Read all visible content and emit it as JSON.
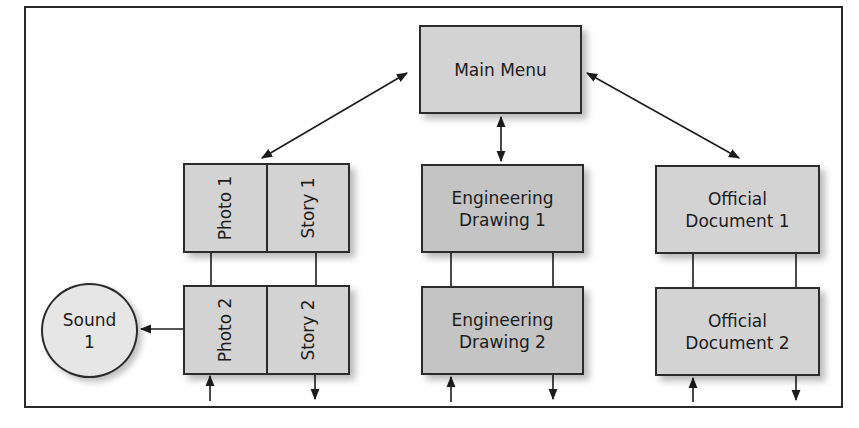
{
  "diagram": {
    "type": "navigation-structure",
    "main_menu": {
      "label": "Main Menu"
    },
    "branches": [
      {
        "id": "photo-story",
        "nodes": [
          {
            "left": "Photo 1",
            "right": "Story 1"
          },
          {
            "left": "Photo 2",
            "right": "Story 2"
          }
        ],
        "side_node": {
          "label_line1": "Sound",
          "label_line2": "1"
        }
      },
      {
        "id": "engineering",
        "nodes": [
          {
            "line1": "Engineering",
            "line2": "Drawing 1"
          },
          {
            "line1": "Engineering",
            "line2": "Drawing 2"
          }
        ]
      },
      {
        "id": "official",
        "nodes": [
          {
            "line1": "Official",
            "line2": "Document 1"
          },
          {
            "line1": "Official",
            "line2": "Document 2"
          }
        ]
      }
    ],
    "connections": [
      {
        "from": "Main Menu",
        "to": "Photo 1 / Story 1",
        "style": "bidirectional-arrow"
      },
      {
        "from": "Main Menu",
        "to": "Engineering Drawing 1",
        "style": "bidirectional-arrow"
      },
      {
        "from": "Main Menu",
        "to": "Official Document 1",
        "style": "bidirectional-arrow"
      },
      {
        "from": "Photo 1",
        "to": "Photo 2",
        "style": "line"
      },
      {
        "from": "Story 1",
        "to": "Story 2",
        "style": "line"
      },
      {
        "from": "Engineering Drawing 1",
        "to": "Engineering Drawing 2",
        "style": "double-line"
      },
      {
        "from": "Official Document 1",
        "to": "Official Document 2",
        "style": "double-line"
      },
      {
        "from": "Photo 2",
        "to": "Sound 1",
        "style": "arrow"
      }
    ],
    "colors": {
      "box_fill": "#d3d3d3",
      "box_fill_dark": "#c4c4c4",
      "circle_fill": "#e6e6e6",
      "stroke": "#2b2b2b"
    }
  }
}
